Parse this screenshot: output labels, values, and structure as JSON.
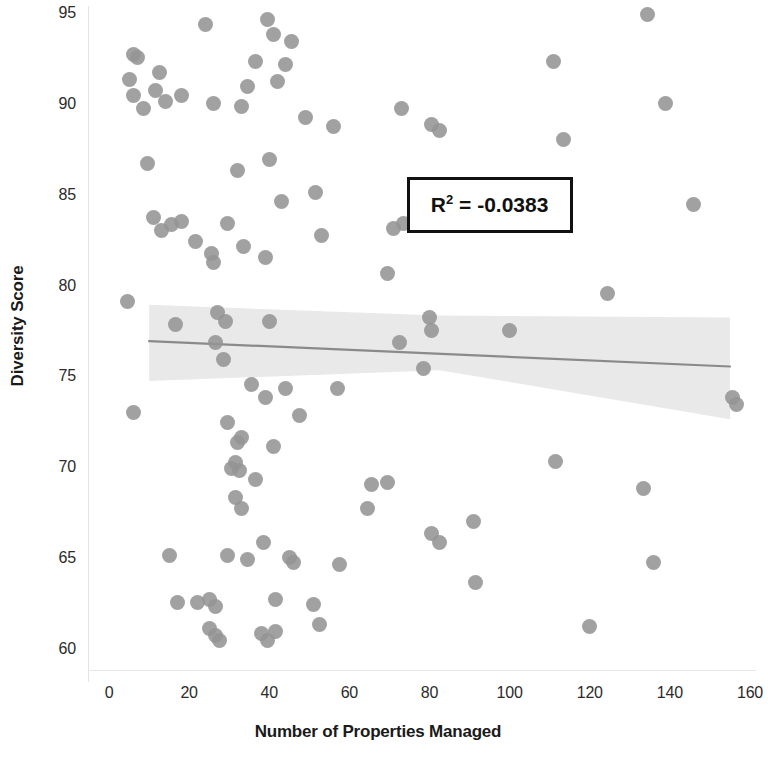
{
  "chart_data": {
    "type": "scatter",
    "title": "",
    "xlabel": "Number of Properties Managed",
    "ylabel": "Diversity Score",
    "xlim": [
      -4,
      162
    ],
    "ylim": [
      58.6,
      96.1
    ],
    "xticks": [
      0,
      20,
      40,
      60,
      80,
      100,
      120,
      140,
      160
    ],
    "yticks": [
      60,
      65,
      70,
      75,
      80,
      85,
      90,
      95
    ],
    "grid": false,
    "legend": null,
    "annotations": [
      {
        "name": "r-squared-box",
        "text": "R² = -0.0383",
        "label_prefix": "R",
        "label_sup": "2",
        "label_suffix": " = -0.0383",
        "x_data": 95,
        "y_data": 84.5
      }
    ],
    "marker": {
      "shape": "circle",
      "size_px": 15,
      "color": "#949494",
      "opacity": 0.88
    },
    "trendline": {
      "name": "linear-regression-line",
      "color": "#8a8a8a",
      "x_start": 10,
      "y_start": 77.0,
      "x_end": 155,
      "y_end": 75.6,
      "slope": -0.00966,
      "intercept": 77.1
    },
    "confidence_band": {
      "name": "confidence-interval-band",
      "color": "#e9e9e9",
      "x_start": 10,
      "x_end": 155,
      "upper_start": 79.0,
      "lower_start": 74.8,
      "upper_mid": 78.4,
      "lower_mid": 75.4,
      "upper_end": 78.3,
      "lower_end": 72.7
    },
    "points": [
      {
        "x": 6.0,
        "y": 92.8
      },
      {
        "x": 7.2,
        "y": 92.6
      },
      {
        "x": 5.0,
        "y": 91.4
      },
      {
        "x": 6.0,
        "y": 90.5
      },
      {
        "x": 12.5,
        "y": 91.8
      },
      {
        "x": 11.5,
        "y": 90.8
      },
      {
        "x": 8.5,
        "y": 89.8
      },
      {
        "x": 18.0,
        "y": 90.5
      },
      {
        "x": 14.0,
        "y": 90.2
      },
      {
        "x": 24.0,
        "y": 94.4
      },
      {
        "x": 26.0,
        "y": 90.1
      },
      {
        "x": 33.0,
        "y": 89.9
      },
      {
        "x": 41.0,
        "y": 93.9
      },
      {
        "x": 39.5,
        "y": 94.7
      },
      {
        "x": 45.5,
        "y": 93.5
      },
      {
        "x": 36.5,
        "y": 92.4
      },
      {
        "x": 44.0,
        "y": 92.2
      },
      {
        "x": 42.0,
        "y": 91.3
      },
      {
        "x": 34.5,
        "y": 91.0
      },
      {
        "x": 49.0,
        "y": 89.3
      },
      {
        "x": 56.0,
        "y": 88.8
      },
      {
        "x": 9.5,
        "y": 86.8
      },
      {
        "x": 32.0,
        "y": 86.4
      },
      {
        "x": 40.0,
        "y": 87.0
      },
      {
        "x": 73.0,
        "y": 89.8
      },
      {
        "x": 82.5,
        "y": 88.6
      },
      {
        "x": 80.5,
        "y": 88.9
      },
      {
        "x": 111.0,
        "y": 92.4
      },
      {
        "x": 113.5,
        "y": 88.1
      },
      {
        "x": 134.5,
        "y": 95.0
      },
      {
        "x": 139.0,
        "y": 90.1
      },
      {
        "x": 11.0,
        "y": 83.8
      },
      {
        "x": 15.5,
        "y": 83.4
      },
      {
        "x": 13.0,
        "y": 83.1
      },
      {
        "x": 18.0,
        "y": 83.6
      },
      {
        "x": 21.5,
        "y": 82.5
      },
      {
        "x": 25.5,
        "y": 81.8
      },
      {
        "x": 26.0,
        "y": 81.3
      },
      {
        "x": 29.5,
        "y": 83.5
      },
      {
        "x": 33.5,
        "y": 82.2
      },
      {
        "x": 39.0,
        "y": 81.6
      },
      {
        "x": 43.0,
        "y": 84.7
      },
      {
        "x": 51.5,
        "y": 85.2
      },
      {
        "x": 53.0,
        "y": 82.8
      },
      {
        "x": 71.0,
        "y": 83.2
      },
      {
        "x": 73.5,
        "y": 83.5
      },
      {
        "x": 69.5,
        "y": 80.7
      },
      {
        "x": 88.0,
        "y": 84.0
      },
      {
        "x": 146.0,
        "y": 84.5
      },
      {
        "x": 4.5,
        "y": 79.2
      },
      {
        "x": 27.0,
        "y": 78.6
      },
      {
        "x": 29.0,
        "y": 78.1
      },
      {
        "x": 40.0,
        "y": 78.1
      },
      {
        "x": 16.5,
        "y": 77.9
      },
      {
        "x": 26.5,
        "y": 76.9
      },
      {
        "x": 28.5,
        "y": 76.0
      },
      {
        "x": 80.0,
        "y": 78.3
      },
      {
        "x": 80.5,
        "y": 77.6
      },
      {
        "x": 100.0,
        "y": 77.6
      },
      {
        "x": 124.5,
        "y": 79.6
      },
      {
        "x": 6.0,
        "y": 73.1
      },
      {
        "x": 35.5,
        "y": 74.6
      },
      {
        "x": 44.0,
        "y": 74.4
      },
      {
        "x": 39.0,
        "y": 73.9
      },
      {
        "x": 47.5,
        "y": 72.9
      },
      {
        "x": 57.0,
        "y": 74.4
      },
      {
        "x": 72.5,
        "y": 76.9
      },
      {
        "x": 78.5,
        "y": 75.5
      },
      {
        "x": 155.5,
        "y": 73.9
      },
      {
        "x": 156.5,
        "y": 73.5
      },
      {
        "x": 29.5,
        "y": 72.5
      },
      {
        "x": 33.0,
        "y": 71.7
      },
      {
        "x": 32.0,
        "y": 71.4
      },
      {
        "x": 41.0,
        "y": 71.2
      },
      {
        "x": 30.5,
        "y": 70.0
      },
      {
        "x": 32.5,
        "y": 69.9
      },
      {
        "x": 31.5,
        "y": 70.3
      },
      {
        "x": 36.5,
        "y": 69.4
      },
      {
        "x": 111.5,
        "y": 70.4
      },
      {
        "x": 65.5,
        "y": 69.1
      },
      {
        "x": 69.5,
        "y": 69.2
      },
      {
        "x": 133.5,
        "y": 68.9
      },
      {
        "x": 31.5,
        "y": 68.4
      },
      {
        "x": 33.0,
        "y": 67.8
      },
      {
        "x": 64.5,
        "y": 67.8
      },
      {
        "x": 80.5,
        "y": 66.4
      },
      {
        "x": 82.5,
        "y": 65.9
      },
      {
        "x": 91.0,
        "y": 67.1
      },
      {
        "x": 15.0,
        "y": 65.2
      },
      {
        "x": 29.5,
        "y": 65.2
      },
      {
        "x": 34.5,
        "y": 65.0
      },
      {
        "x": 38.5,
        "y": 65.9
      },
      {
        "x": 45.0,
        "y": 65.1
      },
      {
        "x": 46.0,
        "y": 64.8
      },
      {
        "x": 57.5,
        "y": 64.7
      },
      {
        "x": 91.5,
        "y": 63.7
      },
      {
        "x": 136.0,
        "y": 64.8
      },
      {
        "x": 17.0,
        "y": 62.6
      },
      {
        "x": 22.0,
        "y": 62.6
      },
      {
        "x": 25.0,
        "y": 62.8
      },
      {
        "x": 26.5,
        "y": 62.4
      },
      {
        "x": 41.5,
        "y": 62.8
      },
      {
        "x": 51.0,
        "y": 62.5
      },
      {
        "x": 52.5,
        "y": 61.4
      },
      {
        "x": 120.0,
        "y": 61.3
      },
      {
        "x": 25.0,
        "y": 61.2
      },
      {
        "x": 26.5,
        "y": 60.8
      },
      {
        "x": 27.5,
        "y": 60.5
      },
      {
        "x": 38.0,
        "y": 60.9
      },
      {
        "x": 39.5,
        "y": 60.5
      },
      {
        "x": 41.5,
        "y": 61.0
      }
    ]
  },
  "axis": {
    "y_title": "Diversity Score",
    "x_title": "Number of Properties Managed",
    "y_tick_labels": [
      "95",
      "90",
      "85",
      "80",
      "75",
      "70",
      "65",
      "60"
    ],
    "x_tick_labels": [
      "0",
      "20",
      "40",
      "60",
      "80",
      "100",
      "120",
      "140",
      "160"
    ]
  },
  "annotation": {
    "r2_prefix": "R",
    "r2_sup": "2",
    "r2_value": " = -0.0383",
    "r2_full": "R² = -0.0383"
  },
  "colors": {
    "marker": "#949494",
    "trendline": "#8a8a8a",
    "band": "#e9e9e9",
    "text": "#1a1a1a",
    "box_border": "#111111"
  }
}
